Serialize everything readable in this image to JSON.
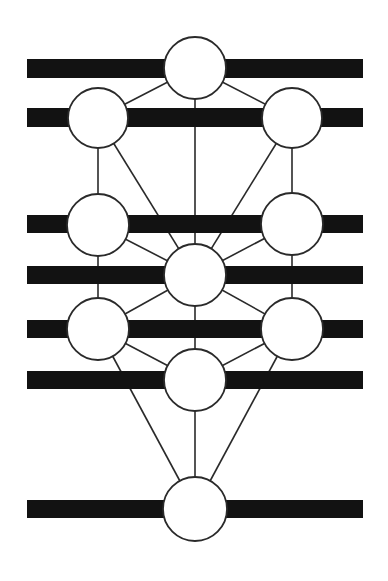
{
  "diagram": {
    "title": "",
    "width": 388,
    "height": 581,
    "colors": {
      "background": "#ffffff",
      "bar": "#121212",
      "line": "#2a2a2a",
      "node_fill": "#ffffff",
      "node_stroke": "#2a2a2a"
    },
    "bars": [
      {
        "id": "bar-1",
        "x1": 27,
        "x2": 363,
        "y": 59,
        "h": 19
      },
      {
        "id": "bar-2",
        "x1": 27,
        "x2": 363,
        "y": 108,
        "h": 19
      },
      {
        "id": "bar-3",
        "x1": 27,
        "x2": 363,
        "y": 215,
        "h": 18
      },
      {
        "id": "bar-4",
        "x1": 27,
        "x2": 363,
        "y": 266,
        "h": 18
      },
      {
        "id": "bar-5",
        "x1": 27,
        "x2": 363,
        "y": 320,
        "h": 18
      },
      {
        "id": "bar-6",
        "x1": 27,
        "x2": 363,
        "y": 371,
        "h": 18
      },
      {
        "id": "bar-7",
        "x1": 27,
        "x2": 363,
        "y": 500,
        "h": 18
      }
    ],
    "nodes": [
      {
        "id": "n1",
        "cx": 195,
        "cy": 68,
        "r": 31
      },
      {
        "id": "n2",
        "cx": 292,
        "cy": 118,
        "r": 30
      },
      {
        "id": "n3",
        "cx": 98,
        "cy": 118,
        "r": 30
      },
      {
        "id": "n4",
        "cx": 292,
        "cy": 224,
        "r": 31
      },
      {
        "id": "n5",
        "cx": 98,
        "cy": 225,
        "r": 31
      },
      {
        "id": "n6",
        "cx": 195,
        "cy": 275,
        "r": 31
      },
      {
        "id": "n7",
        "cx": 292,
        "cy": 329,
        "r": 31
      },
      {
        "id": "n8",
        "cx": 98,
        "cy": 329,
        "r": 31
      },
      {
        "id": "n9",
        "cx": 195,
        "cy": 380,
        "r": 31
      },
      {
        "id": "n10",
        "cx": 195,
        "cy": 509,
        "r": 32
      }
    ],
    "edges": [
      [
        "n1",
        "n2"
      ],
      [
        "n1",
        "n3"
      ],
      [
        "n1",
        "n6"
      ],
      [
        "n3",
        "n5"
      ],
      [
        "n3",
        "n6"
      ],
      [
        "n2",
        "n4"
      ],
      [
        "n2",
        "n6"
      ],
      [
        "n5",
        "n6"
      ],
      [
        "n4",
        "n6"
      ],
      [
        "n5",
        "n8"
      ],
      [
        "n4",
        "n7"
      ],
      [
        "n6",
        "n8"
      ],
      [
        "n6",
        "n7"
      ],
      [
        "n6",
        "n9"
      ],
      [
        "n8",
        "n9"
      ],
      [
        "n7",
        "n9"
      ],
      [
        "n8",
        "n10"
      ],
      [
        "n7",
        "n10"
      ],
      [
        "n9",
        "n10"
      ]
    ]
  }
}
